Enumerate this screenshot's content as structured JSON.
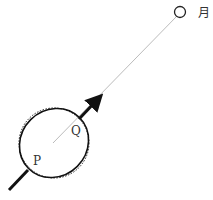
{
  "diagram": {
    "moon_label": "月",
    "point_p_label": "P",
    "point_q_label": "Q",
    "colors": {
      "line": "#222222",
      "thin_line": "#999999"
    }
  }
}
